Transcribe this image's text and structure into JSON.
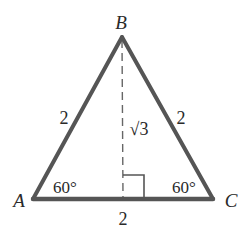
{
  "figure": {
    "type": "equilateral-triangle-with-altitude",
    "colors": {
      "background": "#ffffff",
      "stroke": "#555555",
      "text": "#2a2a2a"
    },
    "vertices": {
      "A": {
        "label": "A",
        "x": 33,
        "y": 199
      },
      "B": {
        "label": "B",
        "x": 122,
        "y": 37
      },
      "C": {
        "label": "C",
        "x": 213,
        "y": 199
      }
    },
    "sides": {
      "AB": {
        "label": "2"
      },
      "BC": {
        "label": "2"
      },
      "AC": {
        "label": "2"
      }
    },
    "altitude": {
      "label": "√3",
      "style": "dashed",
      "foot_x": 123
    },
    "angles": {
      "A": {
        "label": "60°"
      },
      "C": {
        "label": "60°"
      }
    },
    "right_angle_marker": true
  }
}
